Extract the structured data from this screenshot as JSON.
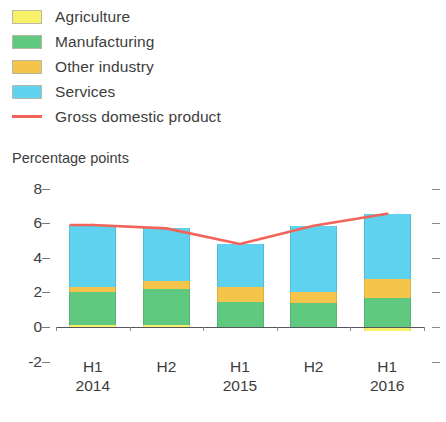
{
  "legend": {
    "items": [
      {
        "label": "Agriculture",
        "color": "#f9f06a",
        "marker": "swatch"
      },
      {
        "label": "Manufacturing",
        "color": "#5ec97f",
        "marker": "swatch"
      },
      {
        "label": "Other industry",
        "color": "#f5c44a",
        "marker": "swatch"
      },
      {
        "label": "Services",
        "color": "#5ed2ee",
        "marker": "swatch"
      },
      {
        "label": "Gross domestic product",
        "color": "#f2645a",
        "marker": "line"
      }
    ]
  },
  "axis": {
    "units_caption": "Percentage points",
    "y_ticks": [
      "8",
      "6",
      "4",
      "2",
      "0",
      "-2"
    ],
    "y_values": [
      8,
      6,
      4,
      2,
      0,
      -2
    ]
  },
  "chart_data": {
    "type": "bar",
    "title": "",
    "subtitle": "",
    "xlabel": "",
    "ylabel": "Percentage points",
    "ylim": [
      -2,
      8
    ],
    "grid": false,
    "legend_position": "top-left",
    "stacked": true,
    "categories": [
      "H1",
      "H2",
      "H1",
      "H2",
      "H1"
    ],
    "category_years": [
      "2014",
      "",
      "2015",
      "",
      "2016"
    ],
    "series": [
      {
        "name": "Agriculture",
        "color": "#f9f06a",
        "values": [
          0.1,
          0.1,
          0.0,
          0.0,
          -0.25
        ]
      },
      {
        "name": "Manufacturing",
        "color": "#5ec97f",
        "values": [
          1.9,
          2.1,
          1.45,
          1.4,
          1.65
        ]
      },
      {
        "name": "Other industry",
        "color": "#f5c44a",
        "values": [
          0.3,
          0.45,
          0.85,
          0.6,
          1.15
        ]
      },
      {
        "name": "Services",
        "color": "#5ed2ee",
        "values": [
          3.6,
          3.05,
          2.5,
          3.85,
          3.75
        ]
      }
    ],
    "overlay_line": {
      "name": "Gross domestic product",
      "color": "#f2645a",
      "values": [
        5.9,
        5.7,
        4.8,
        5.85,
        6.55
      ]
    }
  }
}
